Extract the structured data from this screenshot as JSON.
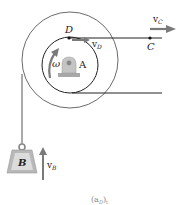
{
  "labels": {
    "D": "D",
    "C": "C",
    "A": "A",
    "B": "B",
    "omega": "ω",
    "vC": "v",
    "vC_sub": "C",
    "vD": "v",
    "vD_sub": "D",
    "vB": "v",
    "vB_sub": "B",
    "caption": "(a",
    "caption_sub": "D",
    "caption_end": ")",
    "caption_tail": "t"
  },
  "colors": {
    "line": "#222222",
    "arrow": "#7a7a7a",
    "weight_fill": "#b8b8b8",
    "weight_face": "#dcdcdc",
    "mount": "#a8a8a8"
  }
}
